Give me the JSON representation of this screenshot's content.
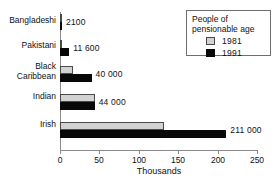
{
  "chart_data": {
    "type": "bar",
    "orientation": "horizontal",
    "title": "",
    "xlabel": "Thousands",
    "ylabel": "",
    "xlim": [
      0,
      250
    ],
    "xticks": [
      0,
      50,
      100,
      150,
      200,
      250
    ],
    "xtick_labels": [
      "0",
      "50",
      "100",
      "150",
      "200",
      "250"
    ],
    "grid": false,
    "legend_position": "top-right",
    "legend_title": "People of\npensionable age",
    "categories": [
      "Bangladeshi",
      "Pakistani",
      "Black\nCaribbean",
      "Indian",
      "Irish"
    ],
    "series": [
      {
        "name": "1981",
        "color": "#d2d2d2",
        "values": [
          1.0,
          3.0,
          17.0,
          44.0,
          132.0
        ]
      },
      {
        "name": "1991",
        "color": "#080808",
        "values": [
          2.1,
          11.6,
          40.0,
          44.0,
          211.0
        ]
      }
    ],
    "data_labels": {
      "series": "1991",
      "values": [
        "2100",
        "11 600",
        "40 000",
        "44 000",
        "211 000"
      ]
    },
    "units": "thousands"
  },
  "axis": {
    "x_title": "Thousands",
    "ticks": [
      {
        "value": 0,
        "label": "0"
      },
      {
        "value": 50,
        "label": "50"
      },
      {
        "value": 100,
        "label": "100"
      },
      {
        "value": 150,
        "label": "150"
      },
      {
        "value": 200,
        "label": "200"
      },
      {
        "value": 250,
        "label": "250"
      }
    ]
  },
  "legend": {
    "title": "People of\npensionable age",
    "entries": [
      {
        "label": "1981",
        "swatch": "light-grey-swatch"
      },
      {
        "label": "1991",
        "swatch": "black-swatch"
      }
    ]
  },
  "groups": [
    {
      "label": "Bangladeshi",
      "bars": [
        {
          "series": "1981",
          "value": 1.0,
          "value_label": ""
        },
        {
          "series": "1991",
          "value": 2.1,
          "value_label": "2100"
        }
      ]
    },
    {
      "label": "Pakistani",
      "bars": [
        {
          "series": "1981",
          "value": 3.0,
          "value_label": ""
        },
        {
          "series": "1991",
          "value": 11.6,
          "value_label": "11 600"
        }
      ]
    },
    {
      "label": "Black\nCaribbean",
      "bars": [
        {
          "series": "1981",
          "value": 17.0,
          "value_label": ""
        },
        {
          "series": "1991",
          "value": 40.0,
          "value_label": "40 000"
        }
      ]
    },
    {
      "label": "Indian",
      "bars": [
        {
          "series": "1981",
          "value": 44.0,
          "value_label": ""
        },
        {
          "series": "1991",
          "value": 44.0,
          "value_label": "44 000"
        }
      ]
    },
    {
      "label": "Irish",
      "bars": [
        {
          "series": "1981",
          "value": 132.0,
          "value_label": ""
        },
        {
          "series": "1991",
          "value": 211.0,
          "value_label": "211 000"
        }
      ]
    }
  ],
  "colors": {
    "series_1981": "#d2d2d2",
    "series_1991": "#080808",
    "axis": "#8a8a8a",
    "text": "#111111",
    "background": "#ffffff"
  }
}
